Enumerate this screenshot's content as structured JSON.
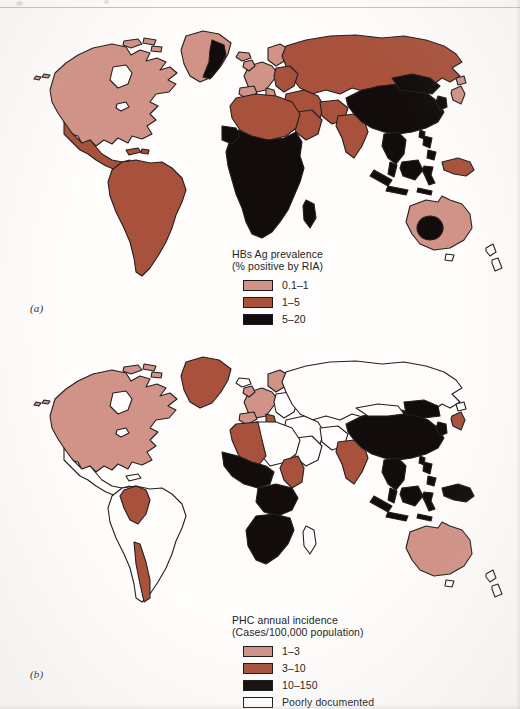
{
  "figure": {
    "background": "#fefdfc",
    "scan_rule_color": "#d8a9a4"
  },
  "palette": {
    "light": "#d19287",
    "medium": "#a8523d",
    "dark": "#120d0c",
    "white": "#ffffff",
    "outline": "#231f1e"
  },
  "panels": [
    {
      "id": "a",
      "part_label": "(a)",
      "legend": {
        "title_line1": "HBs Ag prevalence",
        "title_line2": "(% positive by RIA)",
        "entries": [
          {
            "label": "0.1–1",
            "color": "#d19287",
            "swatch": "filled"
          },
          {
            "label": "1–5",
            "color": "#a8523d",
            "swatch": "filled"
          },
          {
            "label": "5–20",
            "color": "#120d0c",
            "swatch": "filled"
          }
        ]
      },
      "regions": {
        "light": [
          "North America",
          "Canada",
          "United States",
          "Greenland",
          "Western Europe",
          "Australia",
          "Japan",
          "Iceland"
        ],
        "medium": [
          "Mexico",
          "Central America",
          "South America",
          "Russia",
          "Eastern Europe",
          "North Africa",
          "India",
          "Middle East",
          "New Guinea"
        ],
        "dark": [
          "Sub-Saharan Africa",
          "China",
          "Southeast Asia",
          "Indonesia",
          "Philippines",
          "East Greenland coast",
          "Central Australia",
          "Taiwan",
          "Korea"
        ]
      }
    },
    {
      "id": "b",
      "part_label": "(b)",
      "legend": {
        "title_line1": "PHC annual incidence",
        "title_line2": "(Cases/100,000 population)",
        "entries": [
          {
            "label": "1–3",
            "color": "#d19287",
            "swatch": "filled"
          },
          {
            "label": "3–10",
            "color": "#a8523d",
            "swatch": "filled"
          },
          {
            "label": "10–150",
            "color": "#120d0c",
            "swatch": "filled"
          },
          {
            "label": "Poorly documented",
            "color": "#ffffff",
            "swatch": "outline"
          }
        ]
      },
      "regions": {
        "light": [
          "North America",
          "Canada",
          "United States",
          "Western Europe",
          "Australia",
          "Scandinavia"
        ],
        "medium": [
          "Greenland",
          "Colombia",
          "Venezuela",
          "Chile",
          "Algeria",
          "Tunisia",
          "Sudan",
          "Ethiopia",
          "India",
          "Japan",
          "Italy"
        ],
        "dark": [
          "West Africa",
          "Central Africa",
          "Southern Africa",
          "Mozambique",
          "China",
          "Southeast Asia",
          "Indonesia",
          "Philippines",
          "New Guinea",
          "Taiwan",
          "Korea"
        ],
        "white": [
          "Mexico",
          "Central America",
          "Brazil",
          "Argentina",
          "Russia",
          "Central Asia",
          "Middle East",
          "New Zealand"
        ]
      }
    }
  ]
}
